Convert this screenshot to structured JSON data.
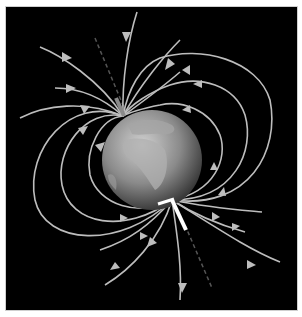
{
  "diagram": {
    "background_color": "#000000",
    "frame_color": "#cfcfcf",
    "field_line_color": "#bdbdbd",
    "globe": {
      "cx": 152,
      "cy": 160,
      "r": 50,
      "fill_light": "#c8c8c8",
      "fill_dark": "#3a3a3a"
    },
    "north_pole": {
      "x": 123,
      "y": 116
    },
    "south_pole": {
      "x": 172,
      "y": 200
    },
    "magnet_color": "#ffffff",
    "axis_color": "#555555"
  }
}
